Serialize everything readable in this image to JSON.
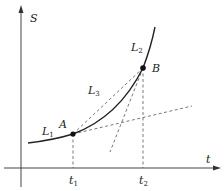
{
  "diagram": {
    "axes": {
      "y_label": "S",
      "x_label": "t"
    },
    "points": [
      {
        "name": "A",
        "x_tick": "t",
        "x_tick_sub": "1"
      },
      {
        "name": "B",
        "x_tick": "t",
        "x_tick_sub": "2"
      }
    ],
    "lines": [
      {
        "name": "L",
        "sub": "1",
        "desc": "tangent at A"
      },
      {
        "name": "L",
        "sub": "2",
        "desc": "tangent at B"
      },
      {
        "name": "L",
        "sub": "3",
        "desc": "secant AB"
      }
    ],
    "colors": {
      "stroke": "#333333",
      "dashed": "#555555",
      "background": "#ffffff"
    }
  }
}
